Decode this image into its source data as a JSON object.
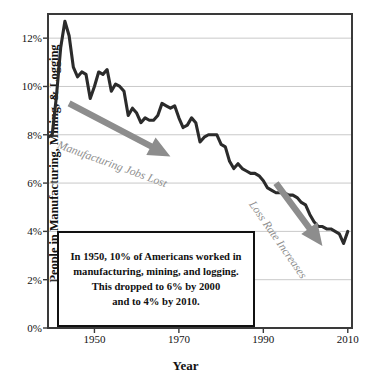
{
  "chart_data": {
    "type": "line",
    "title": "",
    "xlabel": "Year",
    "ylabel": "People in Manufacturing, Mining, & Logging",
    "xlim": [
      1939,
      2011
    ],
    "ylim": [
      0,
      13
    ],
    "grid": true,
    "legend": false,
    "legend_position": "none",
    "y_ticks": [
      "0%",
      "2%",
      "4%",
      "6%",
      "8%",
      "10%",
      "12%"
    ],
    "y_tick_values": [
      0,
      2,
      4,
      6,
      8,
      10,
      12
    ],
    "x_ticks": [
      "1950",
      "1970",
      "1990",
      "2010"
    ],
    "x_tick_values": [
      1950,
      1970,
      1990,
      2010
    ],
    "series": [
      {
        "name": "People in Manufacturing, Mining, & Logging",
        "color": "#2b2b2b",
        "x": [
          1939,
          1940,
          1941,
          1942,
          1943,
          1944,
          1945,
          1946,
          1947,
          1948,
          1949,
          1950,
          1951,
          1952,
          1953,
          1954,
          1955,
          1956,
          1957,
          1958,
          1959,
          1960,
          1961,
          1962,
          1963,
          1964,
          1965,
          1966,
          1967,
          1968,
          1969,
          1970,
          1971,
          1972,
          1973,
          1974,
          1975,
          1976,
          1977,
          1978,
          1979,
          1980,
          1981,
          1982,
          1983,
          1984,
          1985,
          1986,
          1987,
          1988,
          1989,
          1990,
          1991,
          1992,
          1993,
          1994,
          1995,
          1996,
          1997,
          1998,
          1999,
          2000,
          2001,
          2002,
          2003,
          2004,
          2005,
          2006,
          2007,
          2008,
          2009,
          2010
        ],
        "values": [
          7.9,
          8.0,
          9.6,
          11.6,
          12.7,
          12.1,
          10.8,
          10.4,
          10.6,
          10.5,
          9.5,
          10.0,
          10.6,
          10.5,
          10.7,
          9.8,
          10.1,
          10.0,
          9.8,
          8.8,
          9.1,
          8.9,
          8.5,
          8.7,
          8.6,
          8.6,
          8.8,
          9.3,
          9.2,
          9.1,
          9.2,
          8.7,
          8.3,
          8.4,
          8.7,
          8.5,
          7.7,
          7.9,
          8.0,
          8.0,
          8.0,
          7.6,
          7.5,
          6.9,
          6.6,
          6.8,
          6.6,
          6.5,
          6.4,
          6.4,
          6.3,
          6.1,
          5.8,
          5.7,
          5.6,
          5.6,
          5.6,
          5.5,
          5.5,
          5.4,
          5.2,
          5.1,
          4.7,
          4.4,
          4.2,
          4.2,
          4.1,
          4.1,
          4.0,
          3.9,
          3.5,
          4.0
        ],
        "note": "Percent of U.S. population employed in manufacturing, mining, and logging; peak ~12.7% in 1943, ~10% in 1950, ~6% by 2000, ~4% by 2010"
      }
    ],
    "annotations": [
      {
        "id": "manufacturing-jobs-lost",
        "text": "Manufacturing Jobs Lost",
        "color": "#8d8d8d",
        "rotation_deg": 20,
        "arrow": {
          "from": [
            1944,
            9.3
          ],
          "to": [
            1968,
            7.1
          ],
          "color": "#8d8d8d",
          "style": "thick-tapered"
        }
      },
      {
        "id": "loss-rate-increases",
        "text": "Loss Rate Increases",
        "color": "#8d8d8d",
        "rotation_deg": 55,
        "arrow": {
          "from": [
            1993,
            6.0
          ],
          "to": [
            2004,
            3.4
          ],
          "color": "#8d8d8d",
          "style": "thick-tapered"
        }
      }
    ],
    "callout": {
      "lines": [
        "In 1950, 10% of Americans worked in",
        "manufacturing, mining, and logging.",
        "This dropped to 6% by 2000",
        "and to 4% by 2010."
      ]
    },
    "colors": {
      "line": "#2b2b2b",
      "annotation": "#8d8d8d",
      "grid": "#c9c9c9",
      "frame": "#3a3a3a",
      "text": "#111111",
      "background": "#ffffff"
    }
  }
}
